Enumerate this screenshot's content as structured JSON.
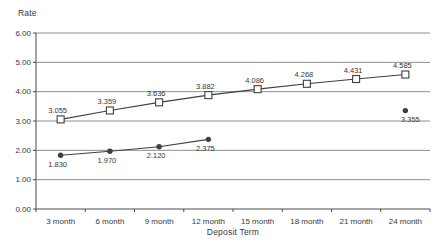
{
  "chart_data": {
    "type": "line",
    "title": "",
    "ylabel": "Rate",
    "xlabel": "Deposit Term",
    "categories": [
      "3 month",
      "6 month",
      "9 month",
      "12 month",
      "15 month",
      "18 month",
      "21 month",
      "24 month"
    ],
    "ylim": [
      0,
      6
    ],
    "ytick_interval": 1,
    "ytick_labels": [
      "0.00",
      "1.00",
      "2.00",
      "3.00",
      "4.00",
      "5.00",
      "6.00"
    ],
    "grid": true,
    "legend_position": "none",
    "series": [
      {
        "name": "square-marker-series",
        "marker": "square",
        "values": [
          3.055,
          3.359,
          3.636,
          3.882,
          4.086,
          4.268,
          4.431,
          4.585
        ],
        "point_labels": [
          "3.055",
          "3.359",
          "3.636",
          "3.882",
          "4.086",
          "4.268",
          "4.431",
          "4.585"
        ],
        "label_position": "above"
      },
      {
        "name": "circle-marker-series",
        "marker": "circle",
        "values": [
          1.83,
          1.97,
          2.12,
          2.375,
          null,
          null,
          null,
          3.355
        ],
        "point_labels": [
          "1.830",
          "1.970",
          "2.120",
          "2.375",
          null,
          null,
          null,
          "3.355"
        ],
        "label_position": "below"
      }
    ],
    "colors": {
      "line": "#3f3f3f",
      "grid": "#8f8f8f",
      "axis": "#4a4a4a",
      "text": "#383838",
      "marker_fill_square": "#ffffff",
      "marker_fill_circle": "#3f3f3f",
      "background": "#ffffff"
    }
  }
}
